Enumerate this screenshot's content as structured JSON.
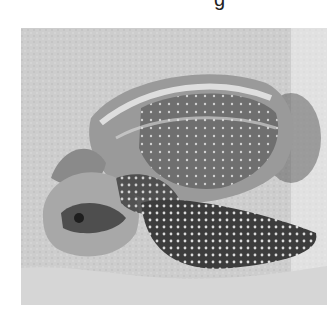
{
  "image": {
    "subject": "Leatherback sea turtle nesting in sand",
    "style": "grayscale photograph",
    "top_text_fragment": "g"
  },
  "colors": {
    "background": "#ffffff",
    "sand": "#cfcfcf",
    "shell_dark": "#3a3a3a",
    "spots": "#e8e8e8"
  }
}
